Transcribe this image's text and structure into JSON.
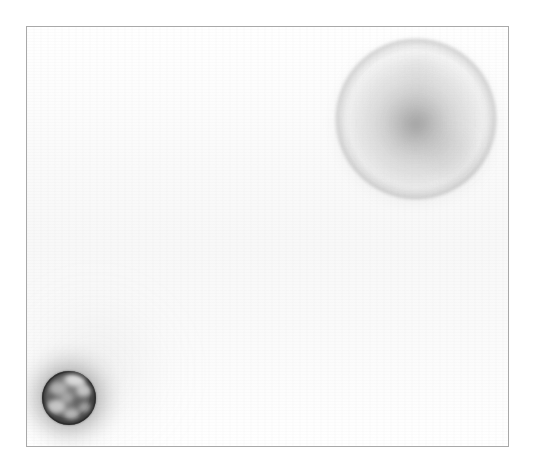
{
  "image": {
    "kind": "scanned-plate",
    "title": "Scanned plate image",
    "width": 535,
    "height": 470,
    "background_color": "#ffffff"
  },
  "frame": {
    "name": "plate-frame",
    "border_color": "#a9a9a9",
    "border_width_px": 1,
    "surface_color": "#fbfbfb",
    "left": 26,
    "top": 26,
    "width": 483,
    "height": 421
  },
  "spots": [
    {
      "id": "large-diffuse-spot",
      "label": "Large diffuse spot",
      "position": "upper-right",
      "center_x": 416,
      "center_y": 119,
      "radius": 81,
      "core_color": "#a8a8a8",
      "edge_color": "#f2f2f2",
      "rim_color": "#8e8e8e",
      "intensity": "light",
      "halo": "soft"
    },
    {
      "id": "small-dark-spot",
      "label": "Small dark mottled spot",
      "position": "lower-left",
      "center_x": 69,
      "center_y": 398,
      "radius": 27,
      "core_color": "#7a7a7a",
      "outline_color": "#2e2e2e",
      "mottle_color": "#e6e6e6",
      "intensity": "dark",
      "halo": "wide-diffuse",
      "halo_radius": 57
    }
  ],
  "texture": {
    "scanlines": "horizontal",
    "scanline_opacity": 0.013,
    "banding": "vertical",
    "banding_opacity": 0.008
  }
}
